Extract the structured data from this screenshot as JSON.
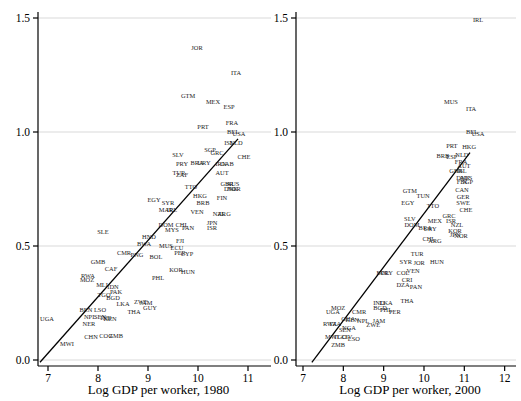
{
  "figure": {
    "background": "#ffffff",
    "text_color": "#1a1a1a",
    "grid_color": "#d9d9d9",
    "axis_color": "#000000",
    "line_color": "#000000"
  },
  "chart_data": {
    "type": "scatter",
    "marker": "country-code-text-labels",
    "legend": "none",
    "grid": "horizontal-light",
    "panels": [
      {
        "xlabel": "Log GDP per worker, 1980",
        "xticks": [
          "7",
          "8",
          "9",
          "10",
          "11"
        ],
        "yticks": [
          "0.0",
          "0.5",
          "1.0",
          "1.5"
        ],
        "xlim": [
          6.8,
          11.45
        ],
        "ylim": [
          -0.03,
          1.53
        ],
        "fit_line": {
          "x1": 6.84,
          "y1": -0.01,
          "x2": 10.8,
          "y2": 0.97
        },
        "points": [
          {
            "code": "JOR",
            "x": 9.98,
            "y": 1.37
          },
          {
            "code": "ITA",
            "x": 10.76,
            "y": 1.26
          },
          {
            "code": "GTM",
            "x": 9.8,
            "y": 1.16
          },
          {
            "code": "MEX",
            "x": 10.3,
            "y": 1.13
          },
          {
            "code": "ESP",
            "x": 10.62,
            "y": 1.11
          },
          {
            "code": "FRA",
            "x": 10.68,
            "y": 1.04
          },
          {
            "code": "PRT",
            "x": 10.1,
            "y": 1.02
          },
          {
            "code": "BEL",
            "x": 10.7,
            "y": 1.0
          },
          {
            "code": "USA",
            "x": 10.82,
            "y": 0.99
          },
          {
            "code": "ISL",
            "x": 10.62,
            "y": 0.95
          },
          {
            "code": "NLD",
            "x": 10.76,
            "y": 0.95
          },
          {
            "code": "SGP",
            "x": 10.24,
            "y": 0.92
          },
          {
            "code": "GRC",
            "x": 10.38,
            "y": 0.91
          },
          {
            "code": "SLV",
            "x": 9.6,
            "y": 0.9
          },
          {
            "code": "CHE",
            "x": 10.92,
            "y": 0.89
          },
          {
            "code": "PRY",
            "x": 9.68,
            "y": 0.86
          },
          {
            "code": "BRA",
            "x": 9.98,
            "y": 0.865
          },
          {
            "code": "URY",
            "x": 10.12,
            "y": 0.865
          },
          {
            "code": "IRN",
            "x": 10.46,
            "y": 0.86
          },
          {
            "code": "GAB",
            "x": 10.58,
            "y": 0.86
          },
          {
            "code": "AUT",
            "x": 10.48,
            "y": 0.82
          },
          {
            "code": "TUR",
            "x": 9.62,
            "y": 0.82
          },
          {
            "code": "ZAF",
            "x": 9.68,
            "y": 0.81
          },
          {
            "code": "TTO",
            "x": 9.86,
            "y": 0.76
          },
          {
            "code": "GBR",
            "x": 10.58,
            "y": 0.77
          },
          {
            "code": "AUS",
            "x": 10.7,
            "y": 0.77
          },
          {
            "code": "DNK",
            "x": 10.66,
            "y": 0.75
          },
          {
            "code": "NOR",
            "x": 10.72,
            "y": 0.75
          },
          {
            "code": "FIN",
            "x": 10.48,
            "y": 0.71
          },
          {
            "code": "EGY",
            "x": 9.12,
            "y": 0.7
          },
          {
            "code": "SYR",
            "x": 9.4,
            "y": 0.69
          },
          {
            "code": "HKG",
            "x": 10.04,
            "y": 0.72
          },
          {
            "code": "BRB",
            "x": 10.1,
            "y": 0.69
          },
          {
            "code": "MAR",
            "x": 9.36,
            "y": 0.66
          },
          {
            "code": "IRL",
            "x": 9.48,
            "y": 0.66
          },
          {
            "code": "VEN",
            "x": 9.98,
            "y": 0.65
          },
          {
            "code": "NZL",
            "x": 10.42,
            "y": 0.64
          },
          {
            "code": "ARG",
            "x": 10.52,
            "y": 0.64
          },
          {
            "code": "JPN",
            "x": 10.28,
            "y": 0.6
          },
          {
            "code": "ISR",
            "x": 10.28,
            "y": 0.58
          },
          {
            "code": "DOM",
            "x": 9.36,
            "y": 0.59
          },
          {
            "code": "CHL",
            "x": 9.68,
            "y": 0.59
          },
          {
            "code": "PAN",
            "x": 9.8,
            "y": 0.58
          },
          {
            "code": "MYS",
            "x": 9.48,
            "y": 0.57
          },
          {
            "code": "SLE",
            "x": 8.1,
            "y": 0.56
          },
          {
            "code": "HND",
            "x": 9.02,
            "y": 0.54
          },
          {
            "code": "BWA",
            "x": 8.92,
            "y": 0.51
          },
          {
            "code": "FJI",
            "x": 9.64,
            "y": 0.52
          },
          {
            "code": "MUS",
            "x": 9.36,
            "y": 0.5
          },
          {
            "code": "ECU",
            "x": 9.58,
            "y": 0.49
          },
          {
            "code": "PER",
            "x": 9.64,
            "y": 0.47
          },
          {
            "code": "CYP",
            "x": 9.78,
            "y": 0.465
          },
          {
            "code": "CMR",
            "x": 8.52,
            "y": 0.47
          },
          {
            "code": "PNG",
            "x": 8.78,
            "y": 0.46
          },
          {
            "code": "BOL",
            "x": 9.16,
            "y": 0.45
          },
          {
            "code": "GMB",
            "x": 8.0,
            "y": 0.43
          },
          {
            "code": "CAF",
            "x": 8.26,
            "y": 0.4
          },
          {
            "code": "RWA",
            "x": 7.8,
            "y": 0.37
          },
          {
            "code": "MOZ",
            "x": 7.78,
            "y": 0.35
          },
          {
            "code": "MLI",
            "x": 8.08,
            "y": 0.33
          },
          {
            "code": "KOR",
            "x": 9.56,
            "y": 0.395
          },
          {
            "code": "HUN",
            "x": 9.8,
            "y": 0.385
          },
          {
            "code": "PHL",
            "x": 9.2,
            "y": 0.36
          },
          {
            "code": "IDN",
            "x": 8.3,
            "y": 0.32
          },
          {
            "code": "PAK",
            "x": 8.36,
            "y": 0.3
          },
          {
            "code": "TGO",
            "x": 8.12,
            "y": 0.285
          },
          {
            "code": "BGD",
            "x": 8.3,
            "y": 0.27
          },
          {
            "code": "LKA",
            "x": 8.5,
            "y": 0.245
          },
          {
            "code": "ZWE",
            "x": 8.86,
            "y": 0.255
          },
          {
            "code": "JAM",
            "x": 8.96,
            "y": 0.25
          },
          {
            "code": "GUY",
            "x": 9.04,
            "y": 0.23
          },
          {
            "code": "BEN",
            "x": 7.76,
            "y": 0.22
          },
          {
            "code": "LSO",
            "x": 8.04,
            "y": 0.22
          },
          {
            "code": "THA",
            "x": 8.72,
            "y": 0.21
          },
          {
            "code": "UGA",
            "x": 6.98,
            "y": 0.18
          },
          {
            "code": "NPL",
            "x": 7.84,
            "y": 0.19
          },
          {
            "code": "SEN",
            "x": 8.04,
            "y": 0.19
          },
          {
            "code": "IND",
            "x": 8.16,
            "y": 0.185
          },
          {
            "code": "KEN",
            "x": 8.24,
            "y": 0.18
          },
          {
            "code": "NER",
            "x": 7.82,
            "y": 0.16
          },
          {
            "code": "CHN",
            "x": 7.86,
            "y": 0.1
          },
          {
            "code": "COG",
            "x": 8.16,
            "y": 0.105
          },
          {
            "code": "ZMB",
            "x": 8.36,
            "y": 0.105
          },
          {
            "code": "MWI",
            "x": 7.38,
            "y": 0.07
          }
        ]
      },
      {
        "xlabel": "Log GDP per worker, 2000",
        "xticks": [
          "7",
          "8",
          "9",
          "10",
          "11",
          "12"
        ],
        "yticks": [
          "0.0",
          "0.5",
          "1.0",
          "1.5"
        ],
        "xlim": [
          6.8,
          12.3
        ],
        "ylim": [
          -0.03,
          1.53
        ],
        "fit_line": {
          "x1": 7.22,
          "y1": -0.01,
          "x2": 11.14,
          "y2": 0.91
        },
        "points": [
          {
            "code": "IRL",
            "x": 11.34,
            "y": 1.49
          },
          {
            "code": "MUS",
            "x": 10.67,
            "y": 1.13
          },
          {
            "code": "ITA",
            "x": 11.17,
            "y": 1.1
          },
          {
            "code": "BEL",
            "x": 11.19,
            "y": 1.0
          },
          {
            "code": "USA",
            "x": 11.34,
            "y": 0.99
          },
          {
            "code": "PRT",
            "x": 10.69,
            "y": 0.94
          },
          {
            "code": "HKG",
            "x": 11.12,
            "y": 0.935
          },
          {
            "code": "BRB",
            "x": 10.47,
            "y": 0.895
          },
          {
            "code": "ESP",
            "x": 10.69,
            "y": 0.89
          },
          {
            "code": "NLD",
            "x": 10.94,
            "y": 0.9
          },
          {
            "code": "FRA",
            "x": 10.92,
            "y": 0.87
          },
          {
            "code": "AUT",
            "x": 10.99,
            "y": 0.85
          },
          {
            "code": "GBR",
            "x": 10.79,
            "y": 0.83
          },
          {
            "code": "ISL",
            "x": 10.94,
            "y": 0.83
          },
          {
            "code": "DNK",
            "x": 10.97,
            "y": 0.8
          },
          {
            "code": "AUS",
            "x": 11.04,
            "y": 0.8
          },
          {
            "code": "FIN",
            "x": 10.94,
            "y": 0.78
          },
          {
            "code": "SGP",
            "x": 11.07,
            "y": 0.78
          },
          {
            "code": "CAN",
            "x": 10.94,
            "y": 0.745
          },
          {
            "code": "GER",
            "x": 10.97,
            "y": 0.715
          },
          {
            "code": "SWE",
            "x": 10.97,
            "y": 0.69
          },
          {
            "code": "CHE",
            "x": 11.04,
            "y": 0.66
          },
          {
            "code": "GTM",
            "x": 9.65,
            "y": 0.74
          },
          {
            "code": "TUN",
            "x": 9.98,
            "y": 0.72
          },
          {
            "code": "EGY",
            "x": 9.6,
            "y": 0.69
          },
          {
            "code": "TTO",
            "x": 10.22,
            "y": 0.675
          },
          {
            "code": "SLV",
            "x": 9.65,
            "y": 0.62
          },
          {
            "code": "MEX",
            "x": 10.27,
            "y": 0.61
          },
          {
            "code": "GRC",
            "x": 10.62,
            "y": 0.63
          },
          {
            "code": "ISR",
            "x": 10.67,
            "y": 0.61
          },
          {
            "code": "DOM",
            "x": 9.7,
            "y": 0.59
          },
          {
            "code": "BRA",
            "x": 10.03,
            "y": 0.58
          },
          {
            "code": "URY",
            "x": 10.15,
            "y": 0.575
          },
          {
            "code": "NZL",
            "x": 10.82,
            "y": 0.59
          },
          {
            "code": "KOR",
            "x": 10.77,
            "y": 0.565
          },
          {
            "code": "JPN",
            "x": 10.77,
            "y": 0.55
          },
          {
            "code": "NOR",
            "x": 10.92,
            "y": 0.545
          },
          {
            "code": "CHL",
            "x": 10.12,
            "y": 0.53
          },
          {
            "code": "ARG",
            "x": 10.27,
            "y": 0.52
          },
          {
            "code": "TUR",
            "x": 9.83,
            "y": 0.465
          },
          {
            "code": "SYR",
            "x": 9.55,
            "y": 0.43
          },
          {
            "code": "JOR",
            "x": 9.88,
            "y": 0.425
          },
          {
            "code": "HUN",
            "x": 10.32,
            "y": 0.43
          },
          {
            "code": "BOL",
            "x": 8.98,
            "y": 0.38
          },
          {
            "code": "PRY",
            "x": 9.08,
            "y": 0.38
          },
          {
            "code": "COL",
            "x": 9.48,
            "y": 0.38
          },
          {
            "code": "VEN",
            "x": 9.73,
            "y": 0.39
          },
          {
            "code": "CRI",
            "x": 9.58,
            "y": 0.35
          },
          {
            "code": "DZA",
            "x": 9.48,
            "y": 0.33
          },
          {
            "code": "PAN",
            "x": 9.8,
            "y": 0.32
          },
          {
            "code": "IND",
            "x": 8.88,
            "y": 0.25
          },
          {
            "code": "LKA",
            "x": 9.06,
            "y": 0.25
          },
          {
            "code": "THA",
            "x": 9.58,
            "y": 0.26
          },
          {
            "code": "BGD",
            "x": 8.91,
            "y": 0.23
          },
          {
            "code": "PHL",
            "x": 9.06,
            "y": 0.22
          },
          {
            "code": "PER",
            "x": 9.28,
            "y": 0.21
          },
          {
            "code": "MOZ",
            "x": 7.87,
            "y": 0.23
          },
          {
            "code": "UGA",
            "x": 7.74,
            "y": 0.21
          },
          {
            "code": "CMR",
            "x": 8.39,
            "y": 0.21
          },
          {
            "code": "NPL",
            "x": 8.49,
            "y": 0.17
          },
          {
            "code": "GHA",
            "x": 8.12,
            "y": 0.18
          },
          {
            "code": "KEN",
            "x": 8.22,
            "y": 0.175
          },
          {
            "code": "SEN",
            "x": 8.04,
            "y": 0.13
          },
          {
            "code": "JAM",
            "x": 8.88,
            "y": 0.17
          },
          {
            "code": "ZWE",
            "x": 8.74,
            "y": 0.155
          },
          {
            "code": "RWA",
            "x": 7.67,
            "y": 0.16
          },
          {
            "code": "TZA",
            "x": 7.79,
            "y": 0.16
          },
          {
            "code": "NGA",
            "x": 8.14,
            "y": 0.14
          },
          {
            "code": "MWI",
            "x": 7.72,
            "y": 0.1
          },
          {
            "code": "TGO",
            "x": 7.92,
            "y": 0.1
          },
          {
            "code": "CIV",
            "x": 8.09,
            "y": 0.1
          },
          {
            "code": "LSO",
            "x": 8.26,
            "y": 0.09
          },
          {
            "code": "ZMB",
            "x": 7.87,
            "y": 0.065
          }
        ]
      }
    ]
  }
}
